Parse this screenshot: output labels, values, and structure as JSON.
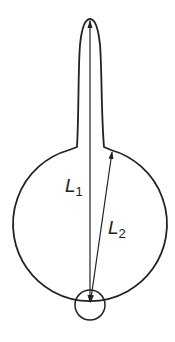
{
  "diagram": {
    "type": "flask-shape-with-lengths",
    "colors": {
      "stroke": "#222222",
      "background": "#ffffff"
    },
    "labels": {
      "l1": {
        "symbol": "L",
        "subscript": "1"
      },
      "l2": {
        "symbol": "L",
        "subscript": "2"
      }
    },
    "elements": [
      "neck-tube",
      "bulb-circle",
      "pivot-circle",
      "arrow-l1",
      "arrow-l2"
    ]
  }
}
